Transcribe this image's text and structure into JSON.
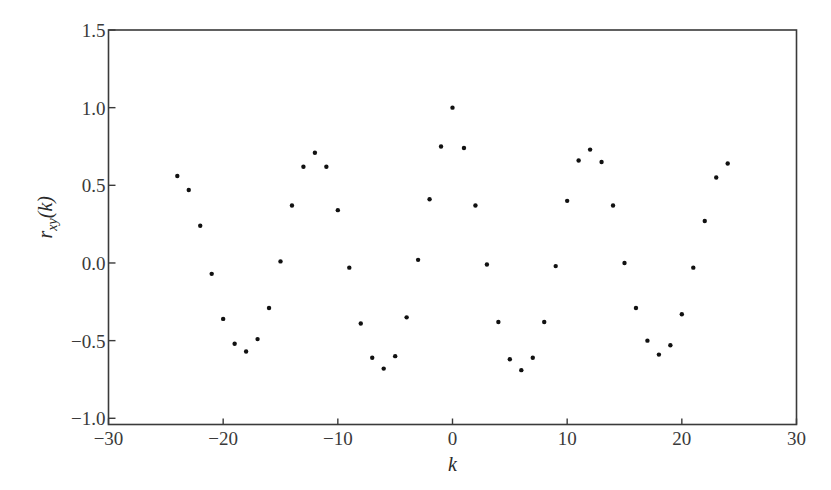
{
  "chart_data": {
    "type": "scatter",
    "title": "",
    "xlabel": "k",
    "ylabel": "r_xy(k)",
    "ylabel_parts": {
      "base": "r",
      "sub": "xy",
      "arg": "(k)"
    },
    "xlim": [
      -30,
      30
    ],
    "ylim": [
      -1.04,
      1.5
    ],
    "xticks": [
      -30,
      -20,
      -10,
      0,
      10,
      20,
      30
    ],
    "xtick_labels": [
      "−30",
      "−20",
      "−10",
      "0",
      "10",
      "20",
      "30"
    ],
    "yticks": [
      1.5,
      1.0,
      0.5,
      0.0,
      -0.5,
      -1.0
    ],
    "ytick_labels": [
      "1.5",
      "1.0",
      "0.5",
      "0.0",
      "−0.5",
      "−1.0"
    ],
    "grid": false,
    "legend": null,
    "marker_color": "#111111",
    "axis_color": "#3a3a3a",
    "series": [
      {
        "name": "r_xy(k)",
        "x": [
          -24,
          -23,
          -22,
          -21,
          -20,
          -19,
          -18,
          -17,
          -16,
          -15,
          -14,
          -13,
          -12,
          -11,
          -10,
          -9,
          -8,
          -7,
          -6,
          -5,
          -4,
          -3,
          -2,
          -1,
          0,
          1,
          2,
          3,
          4,
          5,
          6,
          7,
          8,
          9,
          10,
          11,
          12,
          13,
          14,
          15,
          16,
          17,
          18,
          19,
          20,
          21,
          22,
          23,
          24
        ],
        "values": [
          0.56,
          0.47,
          0.24,
          -0.07,
          -0.36,
          -0.52,
          -0.57,
          -0.49,
          -0.29,
          0.01,
          0.37,
          0.62,
          0.71,
          0.62,
          0.34,
          -0.03,
          -0.39,
          -0.61,
          -0.68,
          -0.6,
          -0.35,
          0.02,
          0.41,
          0.75,
          1.0,
          0.74,
          0.37,
          -0.01,
          -0.38,
          -0.62,
          -0.69,
          -0.61,
          -0.38,
          -0.02,
          0.4,
          0.66,
          0.73,
          0.65,
          0.37,
          0.0,
          -0.29,
          -0.5,
          -0.59,
          -0.53,
          -0.33,
          -0.03,
          0.27,
          0.55,
          0.64
        ]
      }
    ]
  }
}
